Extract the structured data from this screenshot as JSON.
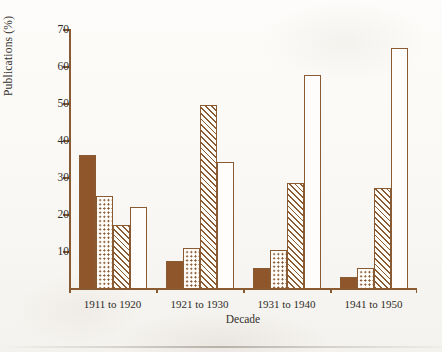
{
  "chart_data": {
    "type": "bar",
    "title": "",
    "xlabel": "Decade",
    "ylabel": "Publications (%)",
    "categories": [
      "1911 to 1920",
      "1921 to 1930",
      "1931 to 1940",
      "1941 to 1950"
    ],
    "ylim": [
      0,
      70
    ],
    "yticks": [
      10,
      20,
      30,
      40,
      50,
      60,
      70
    ],
    "grid": false,
    "legend": "none",
    "series": [
      {
        "name": "solid",
        "pattern": "solid-brown",
        "values": [
          36,
          7.5,
          5.5,
          3
        ]
      },
      {
        "name": "dotted",
        "pattern": "brown-dots-on-white",
        "values": [
          25,
          11,
          10.5,
          5.5
        ]
      },
      {
        "name": "hatched",
        "pattern": "brown-diagonal-hatch",
        "values": [
          17,
          49.5,
          28.5,
          27
        ]
      },
      {
        "name": "open",
        "pattern": "white-outline",
        "values": [
          22,
          34,
          57.5,
          65
        ]
      }
    ]
  },
  "colors": {
    "ink": "#8a5a33",
    "fill_solid": "#8f562c",
    "text": "#2e2b27",
    "paper": "#fbfaf7"
  }
}
